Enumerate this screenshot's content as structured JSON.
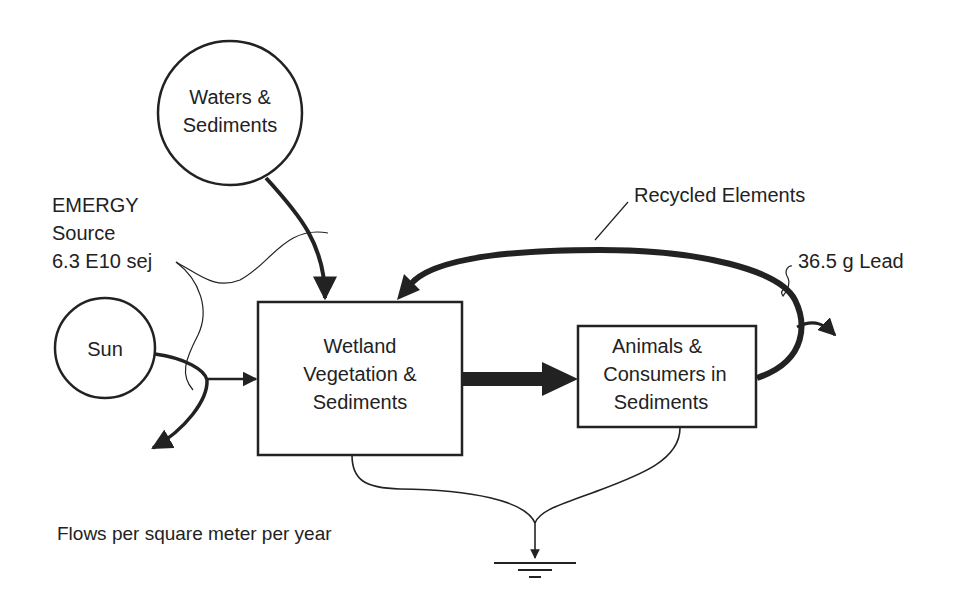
{
  "diagram": {
    "nodes": {
      "waters": {
        "line1": "Waters &",
        "line2": "Sediments"
      },
      "sun": {
        "label": "Sun"
      },
      "wetland": {
        "line1": "Wetland",
        "line2": "Vegetation &",
        "line3": "Sediments"
      },
      "animals": {
        "line1": "Animals &",
        "line2": "Consumers in",
        "line3": "Sediments"
      }
    },
    "annotations": {
      "emergy": {
        "line1": "EMERGY",
        "line2": "Source",
        "line3": "6.3 E10 sej"
      },
      "recycled": "Recycled Elements",
      "lead": "36.5 g Lead",
      "footnote": "Flows per square meter per year"
    },
    "colors": {
      "ink": "#222222",
      "background": "#ffffff"
    }
  }
}
